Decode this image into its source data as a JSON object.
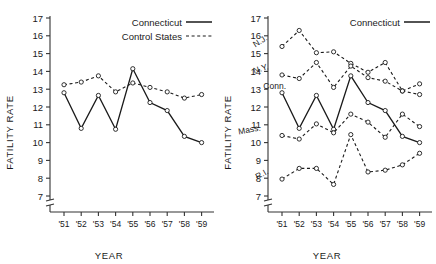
{
  "figure": {
    "panels": [
      {
        "id": "left",
        "ylabel": "FATILITY RATE",
        "xlabel": "YEAR",
        "legend": [
          {
            "label": "Connecticut",
            "style": "solid"
          },
          {
            "label": "Control States",
            "style": "dashed"
          }
        ]
      },
      {
        "id": "right",
        "ylabel": "FATILITY RATE",
        "xlabel": "YEAR",
        "legend": [
          {
            "label": "Connecticut",
            "style": "solid"
          }
        ]
      }
    ]
  },
  "chart_data": [
    {
      "type": "line",
      "title": "",
      "xlabel": "YEAR",
      "ylabel": "FATILITY RATE",
      "categories": [
        "'51",
        "'52",
        "'53",
        "'54",
        "'55",
        "'56",
        "'57",
        "'58",
        "'59"
      ],
      "ylim": [
        7,
        17
      ],
      "yticks": [
        7,
        8,
        9,
        10,
        11,
        12,
        13,
        14,
        15,
        16,
        17
      ],
      "grid": false,
      "legend_position": "top-right",
      "series": [
        {
          "name": "Connecticut",
          "style": "solid",
          "values": [
            12.8,
            10.8,
            12.65,
            10.75,
            14.15,
            12.25,
            11.8,
            10.35,
            10.0
          ]
        },
        {
          "name": "Control States",
          "style": "dashed",
          "values": [
            13.25,
            13.4,
            13.75,
            12.85,
            13.35,
            13.1,
            12.85,
            12.5,
            12.7
          ]
        }
      ]
    },
    {
      "type": "line",
      "title": "",
      "xlabel": "YEAR",
      "ylabel": "FATILITY RATE",
      "categories": [
        "'51",
        "'52",
        "'53",
        "'54",
        "'55",
        "'56",
        "'57",
        "'58",
        "'59"
      ],
      "ylim": [
        7,
        17
      ],
      "yticks": [
        7,
        8,
        9,
        10,
        11,
        12,
        13,
        14,
        15,
        16,
        17
      ],
      "grid": false,
      "legend_position": "top-right",
      "series": [
        {
          "name": "N.J.",
          "style": "dashed",
          "values": [
            15.4,
            16.3,
            15.05,
            15.1,
            14.45,
            13.95,
            14.5,
            12.9,
            13.3
          ]
        },
        {
          "name": "N.Y.",
          "style": "dashed",
          "values": [
            13.8,
            13.6,
            14.5,
            13.1,
            14.3,
            13.65,
            13.45,
            12.9,
            12.7
          ]
        },
        {
          "name": "Conn.",
          "style": "solid",
          "values": [
            12.8,
            10.8,
            12.65,
            10.75,
            13.75,
            12.25,
            11.8,
            10.35,
            10.0
          ]
        },
        {
          "name": "Mass.",
          "style": "dashed",
          "values": [
            10.4,
            10.2,
            11.05,
            10.55,
            11.6,
            11.15,
            10.3,
            11.6,
            10.9
          ]
        },
        {
          "name": "R.I.",
          "style": "dashed",
          "values": [
            7.95,
            8.55,
            8.55,
            7.65,
            10.45,
            8.35,
            8.45,
            8.75,
            9.4
          ]
        }
      ]
    }
  ]
}
